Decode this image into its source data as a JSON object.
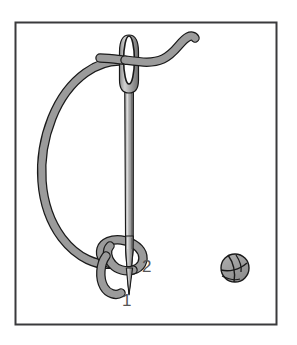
{
  "illustration": {
    "title": "French knot stitch diagram",
    "frame": {
      "border_color": "#3a3a3c",
      "fill_color": "#ffffff",
      "x": 15,
      "y": 22,
      "width": 262,
      "height": 303
    },
    "palette": {
      "thread_fill": "#9b9b9b",
      "thread_outline": "#1a1a1a",
      "needle_fill": "#b8b8b8",
      "needle_outline": "#1a1a1a",
      "needle_shadow": "#6e6e6e",
      "label_color": "#555555",
      "background": "#ffffff"
    },
    "elements": [
      {
        "name": "needle",
        "description": "vertical sewing needle with elongated eye at top and tapered point at bottom"
      },
      {
        "name": "thread",
        "description": "gray thread looping from the needle eye around in a large arc to a coil at the needle point"
      },
      {
        "name": "thread-loop",
        "description": "small loop of thread wrapped around the needle shaft near the point"
      },
      {
        "name": "finished-knot",
        "description": "small completed french knot shown at lower right"
      }
    ],
    "labels": [
      {
        "id": "point-1",
        "text": "1",
        "x": 122,
        "y": 292
      },
      {
        "id": "point-2",
        "text": "2",
        "x": 142,
        "y": 258
      }
    ]
  }
}
